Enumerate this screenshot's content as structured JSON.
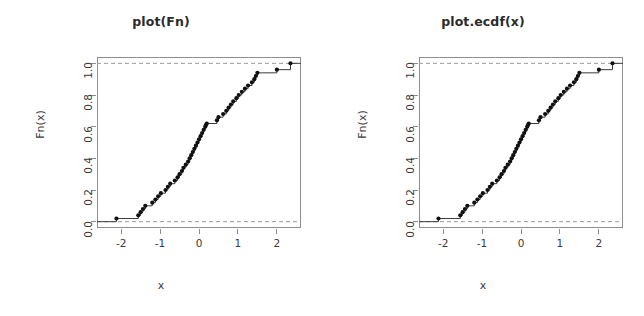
{
  "figure": {
    "background": "#ffffff",
    "axis_color": "#8d8d8d",
    "line_color": "#3b3b3b",
    "point_color": "#101010",
    "dash_color": "#9a9a9a",
    "panel_count": 2
  },
  "panels": [
    {
      "title": "plot(Fn)",
      "xlabel": "x",
      "ylabel": "Fn(x)"
    },
    {
      "title": "plot.ecdf(x)",
      "xlabel": "x",
      "ylabel": "Fn(x)"
    }
  ],
  "axes": {
    "x_ticks": [
      "-2",
      "-1",
      "0",
      "1",
      "2"
    ],
    "x_tick_values": [
      -2,
      -1,
      0,
      1,
      2
    ],
    "y_ticks": [
      "0.0",
      "0.2",
      "0.4",
      "0.6",
      "0.8",
      "1.0"
    ],
    "y_tick_values": [
      0.0,
      0.2,
      0.4,
      0.6,
      0.8,
      1.0
    ],
    "xlim": [
      -2.62,
      2.62
    ],
    "ylim": [
      -0.04,
      1.04
    ],
    "grid": false
  },
  "chart_data": {
    "type": "line",
    "subtype": "ecdf-step",
    "title": "plot(Fn)",
    "xlabel": "x",
    "ylabel": "Fn(x)",
    "xlim": [
      -2.62,
      2.62
    ],
    "ylim": [
      -0.04,
      1.04
    ],
    "grid": false,
    "legend": null,
    "n": 50,
    "annotations": [
      {
        "text": "dashed reference line",
        "y": 0.0
      },
      {
        "text": "dashed reference line",
        "y": 1.0
      }
    ],
    "x": [
      -2.12,
      -1.56,
      -1.5,
      -1.44,
      -1.38,
      -1.2,
      -1.12,
      -1.05,
      -0.98,
      -0.86,
      -0.8,
      -0.74,
      -0.62,
      -0.55,
      -0.5,
      -0.44,
      -0.4,
      -0.34,
      -0.28,
      -0.24,
      -0.2,
      -0.16,
      -0.12,
      -0.08,
      -0.04,
      0.0,
      0.04,
      0.08,
      0.12,
      0.16,
      0.18,
      0.2,
      0.46,
      0.5,
      0.62,
      0.7,
      0.76,
      0.82,
      0.88,
      0.96,
      1.02,
      1.1,
      1.18,
      1.26,
      1.36,
      1.42,
      1.46,
      1.5,
      2.0,
      2.35
    ],
    "y": [
      0.02,
      0.04,
      0.06,
      0.08,
      0.1,
      0.12,
      0.14,
      0.16,
      0.18,
      0.2,
      0.22,
      0.24,
      0.26,
      0.28,
      0.3,
      0.32,
      0.34,
      0.36,
      0.38,
      0.4,
      0.42,
      0.44,
      0.46,
      0.48,
      0.5,
      0.52,
      0.54,
      0.56,
      0.58,
      0.6,
      0.61,
      0.62,
      0.64,
      0.66,
      0.68,
      0.7,
      0.72,
      0.74,
      0.76,
      0.78,
      0.8,
      0.82,
      0.84,
      0.86,
      0.88,
      0.9,
      0.92,
      0.94,
      0.96,
      1.0
    ]
  }
}
